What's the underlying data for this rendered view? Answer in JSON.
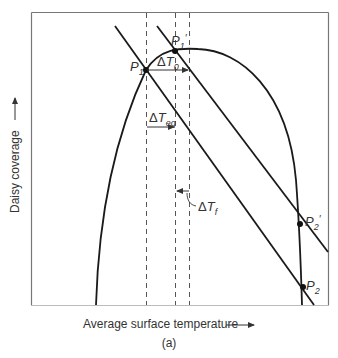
{
  "figure": {
    "caption": "(a)",
    "x_axis_label": "Average surface temperature",
    "y_axis_label": "Daisy coverage",
    "colors": {
      "line": "#1a1a1a",
      "frame": "#777777",
      "text": "#333333"
    }
  },
  "points": {
    "p1": {
      "base": "P",
      "sub": "1",
      "prime": ""
    },
    "p1_prime": {
      "base": "P",
      "sub": "1",
      "prime": "′"
    },
    "p2": {
      "base": "P",
      "sub": "2",
      "prime": ""
    },
    "p2_prime": {
      "base": "P",
      "sub": "2",
      "prime": "′"
    }
  },
  "annotations": {
    "delta_t0": {
      "delta": "Δ",
      "base": "T",
      "sub": "0"
    },
    "delta_teq": {
      "delta": "Δ",
      "base": "T",
      "sub": "eq"
    },
    "delta_tf": {
      "delta": "Δ",
      "base": "T",
      "sub": "f"
    }
  }
}
